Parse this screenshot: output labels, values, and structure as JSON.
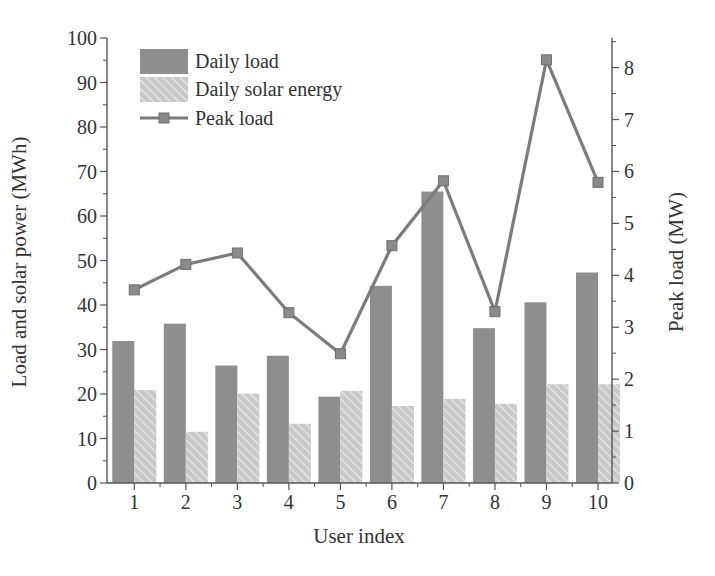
{
  "chart_data": {
    "type": "bar",
    "title": "",
    "xlabel": "User index",
    "ylabel": "Load and solar power (MWh)",
    "y2label": "Peak load (MW)",
    "categories": [
      "1",
      "2",
      "3",
      "4",
      "5",
      "6",
      "7",
      "8",
      "9",
      "10"
    ],
    "ylim": [
      0,
      100
    ],
    "y2lim": [
      0,
      8.57
    ],
    "yticks": [
      0,
      10,
      20,
      30,
      40,
      50,
      60,
      70,
      80,
      90,
      100
    ],
    "y2ticks": [
      0,
      1,
      2,
      3,
      4,
      5,
      6,
      7,
      8
    ],
    "grid": false,
    "legend_position": "upper left",
    "series": [
      {
        "name": "Daily load",
        "type": "bar",
        "axis": "left",
        "color": "#8e8e8e",
        "values": [
          31.9,
          35.8,
          26.4,
          28.6,
          19.4,
          44.3,
          65.5,
          34.8,
          40.6,
          47.3
        ]
      },
      {
        "name": "Daily solar energy",
        "type": "bar",
        "axis": "left",
        "color": "#cfcfcf",
        "pattern": "hatched",
        "values": [
          20.9,
          11.5,
          20.1,
          13.3,
          20.7,
          17.3,
          18.9,
          17.8,
          22.2,
          22.2
        ]
      },
      {
        "name": "Peak load",
        "type": "line",
        "axis": "right",
        "color": "#7c7c7c",
        "marker": "square",
        "values": [
          3.72,
          4.21,
          4.43,
          3.28,
          2.49,
          4.57,
          5.82,
          3.3,
          8.15,
          5.79
        ]
      }
    ]
  }
}
